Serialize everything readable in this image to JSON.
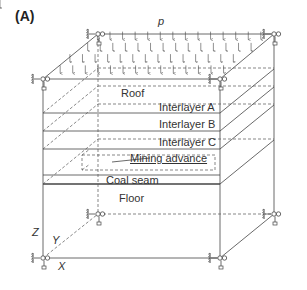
{
  "figure": {
    "panel_label": "(A)",
    "load_label": "p",
    "layers": [
      {
        "name": "Roof"
      },
      {
        "name": "Interlayer A"
      },
      {
        "name": "Interlayer B"
      },
      {
        "name": "Interlayer C"
      },
      {
        "name": "Coal seam"
      },
      {
        "name": "Floor"
      }
    ],
    "annotation": "Mining advance",
    "axes": {
      "z": "Z",
      "y": "Y",
      "x": "X"
    },
    "colors": {
      "line": "#444444",
      "text": "#333333"
    }
  }
}
